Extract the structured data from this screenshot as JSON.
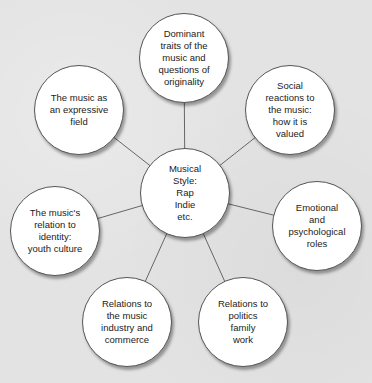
{
  "diagram": {
    "type": "hub-and-spoke",
    "center": {
      "label": "Musical\nStyle:\nRap\nIndie\netc.",
      "x": 185,
      "y": 193
    },
    "nodes": [
      {
        "id": "dominant-traits",
        "label": "Dominant\ntraits of the\nmusic and\nquestions of\noriginality",
        "x": 184,
        "y": 58
      },
      {
        "id": "social-reactions",
        "label": "Social\nreactions to\nthe music:\nhow it is\nvalued",
        "x": 290,
        "y": 110
      },
      {
        "id": "emotional-roles",
        "label": "Emotional\nand\npsychological\nroles",
        "x": 317,
        "y": 226
      },
      {
        "id": "relations-politics",
        "label": "Relations to\npolitics\nfamily\nwork",
        "x": 243,
        "y": 322
      },
      {
        "id": "relations-industry",
        "label": "Relations to\nthe music\nindustry and\ncommerce",
        "x": 127,
        "y": 322
      },
      {
        "id": "identity",
        "label": "The music's\nrelation to\nidentity:\nyouth culture",
        "x": 55,
        "y": 231
      },
      {
        "id": "expressive-field",
        "label": "The music as\nan expressive\nfield",
        "x": 79,
        "y": 110
      }
    ],
    "colors": {
      "background": "#e3e3e3",
      "node_fill": "#ffffff",
      "node_border": "#555555",
      "line": "#666666",
      "text": "#222222"
    }
  }
}
